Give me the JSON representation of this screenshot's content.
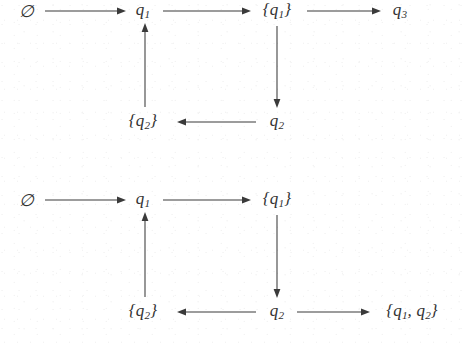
{
  "figure": {
    "background_color": "#ffffff",
    "ink_color": "#323232",
    "arrow_color": "#3a3a3a",
    "diagrams": [
      {
        "id": "diagram-1",
        "nodes": [
          {
            "id": "d1-empty",
            "label": "∅",
            "base": "",
            "sub": "",
            "x": 27,
            "y": 11
          },
          {
            "id": "d1-q1",
            "label": "q1",
            "base": "q",
            "sub": "1",
            "x": 143,
            "y": 11
          },
          {
            "id": "d1-set-q1",
            "label": "{q1}",
            "base": "q",
            "sub": "1",
            "x": 277,
            "y": 11
          },
          {
            "id": "d1-q3",
            "label": "q3",
            "base": "q",
            "sub": "3",
            "x": 400,
            "y": 11
          },
          {
            "id": "d1-set-q2",
            "label": "{q2}",
            "base": "q",
            "sub": "2",
            "x": 143,
            "y": 122
          },
          {
            "id": "d1-q2",
            "label": "q2",
            "base": "q",
            "sub": "2",
            "x": 277,
            "y": 122
          }
        ],
        "edges": [
          {
            "id": "d1-edge-empty-to-q1",
            "from": "d1-empty",
            "to": "d1-q1",
            "direction": "right"
          },
          {
            "id": "d1-edge-q1-to-setq1",
            "from": "d1-q1",
            "to": "d1-set-q1",
            "direction": "right"
          },
          {
            "id": "d1-edge-setq1-to-q3",
            "from": "d1-set-q1",
            "to": "d1-q3",
            "direction": "right"
          },
          {
            "id": "d1-edge-setq1-to-q2",
            "from": "d1-set-q1",
            "to": "d1-q2",
            "direction": "down"
          },
          {
            "id": "d1-edge-q2-to-setq2",
            "from": "d1-q2",
            "to": "d1-set-q2",
            "direction": "left"
          },
          {
            "id": "d1-edge-setq2-to-q1",
            "from": "d1-set-q2",
            "to": "d1-q1",
            "direction": "up"
          }
        ]
      },
      {
        "id": "diagram-2",
        "nodes": [
          {
            "id": "d2-empty",
            "label": "∅",
            "base": "",
            "sub": "",
            "x": 27,
            "y": 28
          },
          {
            "id": "d2-q1",
            "label": "q1",
            "base": "q",
            "sub": "1",
            "x": 143,
            "y": 28
          },
          {
            "id": "d2-set-q1",
            "label": "{q1}",
            "base": "q",
            "sub": "1",
            "x": 277,
            "y": 28
          },
          {
            "id": "d2-set-q2",
            "label": "{q2}",
            "base": "q",
            "sub": "2",
            "x": 143,
            "y": 140
          },
          {
            "id": "d2-q2",
            "label": "q2",
            "base": "q",
            "sub": "2",
            "x": 277,
            "y": 140
          },
          {
            "id": "d2-set-q1-q2",
            "label": "{q1, q2}",
            "base": "q",
            "sub": "1",
            "x": 412,
            "y": 140
          }
        ],
        "edges": [
          {
            "id": "d2-edge-empty-to-q1",
            "from": "d2-empty",
            "to": "d2-q1",
            "direction": "right"
          },
          {
            "id": "d2-edge-q1-to-setq1",
            "from": "d2-q1",
            "to": "d2-set-q1",
            "direction": "right"
          },
          {
            "id": "d2-edge-setq1-to-q2",
            "from": "d2-set-q1",
            "to": "d2-q2",
            "direction": "down"
          },
          {
            "id": "d2-edge-q2-to-setq2",
            "from": "d2-q2",
            "to": "d2-set-q2",
            "direction": "left"
          },
          {
            "id": "d2-edge-q2-to-setq1q2",
            "from": "d2-q2",
            "to": "d2-set-q1-q2",
            "direction": "right"
          },
          {
            "id": "d2-edge-setq2-to-q1",
            "from": "d2-set-q2",
            "to": "d2-q1",
            "direction": "up"
          }
        ]
      }
    ]
  },
  "labels": {
    "empty_set": "∅",
    "q1": "q",
    "q1_sub": "1",
    "q2": "q",
    "q2_sub": "2",
    "q3": "q",
    "q3_sub": "3",
    "brace_open": "{",
    "brace_close": "}",
    "comma": ","
  }
}
